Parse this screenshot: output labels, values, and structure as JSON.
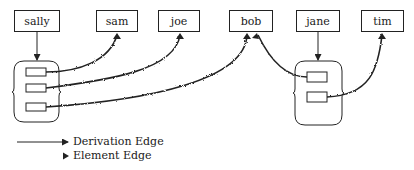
{
  "nodes": [
    {
      "id": "sally",
      "label": "sally",
      "x": 14,
      "y": 10,
      "w": 46,
      "h": 22
    },
    {
      "id": "sam",
      "label": "sam",
      "x": 96,
      "y": 10,
      "w": 42,
      "h": 22
    },
    {
      "id": "joe",
      "label": "joe",
      "x": 158,
      "y": 10,
      "w": 42,
      "h": 22
    },
    {
      "id": "bob",
      "label": "bob",
      "x": 229,
      "y": 10,
      "w": 44,
      "h": 22
    },
    {
      "id": "jane",
      "label": "jane",
      "x": 296,
      "y": 10,
      "w": 44,
      "h": 22
    },
    {
      "id": "tim",
      "label": "tim",
      "x": 361,
      "y": 10,
      "w": 43,
      "h": 22
    }
  ],
  "groups": [
    {
      "id": "sally-set",
      "owner": "sally",
      "element_count": 3
    },
    {
      "id": "jane-set",
      "owner": "jane",
      "element_count": 2
    }
  ],
  "edges": {
    "derivation": [
      {
        "from": "sally",
        "to": "sally-set"
      },
      {
        "from": "jane",
        "to": "jane-set"
      }
    ],
    "element": [
      {
        "from": "sally-set.element-1",
        "to": "sam"
      },
      {
        "from": "sally-set.element-2",
        "to": "joe"
      },
      {
        "from": "sally-set.element-3",
        "to": "bob"
      },
      {
        "from": "bob",
        "to": "jane-set.element-1"
      },
      {
        "from": "jane-set.element-2",
        "to": "tim"
      }
    ]
  },
  "legend": {
    "derivation_label": "Derivation Edge",
    "element_label": "Element Edge"
  },
  "colors": {
    "stroke": "#222222",
    "background": "#ffffff"
  }
}
